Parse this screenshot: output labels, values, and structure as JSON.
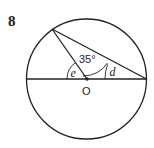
{
  "problem": {
    "number": "8"
  },
  "figure": {
    "circle": {
      "cx": 86.5,
      "cy": 79,
      "r": 60
    },
    "center_label": "O",
    "points": {
      "center": [
        87,
        79
      ],
      "diameter_left": [
        26.5,
        79
      ],
      "diameter_right": [
        146.5,
        79
      ],
      "top_point": [
        52,
        29
      ]
    },
    "angles": {
      "at_center_upper": {
        "label": "35°",
        "value_deg": 35
      },
      "at_center_left": {
        "label": "e"
      },
      "at_right_end": {
        "label": "d"
      }
    },
    "stroke_color": "#222222"
  }
}
